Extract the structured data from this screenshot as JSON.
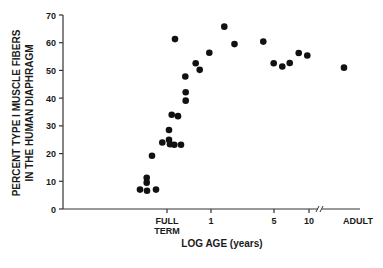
{
  "chart_data": {
    "type": "scatter",
    "title": "",
    "ylabel_line1": "PERCENT TYPE I MUSCLE FIBERS",
    "ylabel_line2": "IN THE HUMAN DIAPHRAGM",
    "xlabel": "LOG AGE (years)",
    "ylim": [
      0,
      70
    ],
    "yticks": [
      0,
      10,
      20,
      30,
      40,
      50,
      60,
      70
    ],
    "xticks": [
      {
        "label": "FULL",
        "label2": "TERM",
        "px": 167
      },
      {
        "label": "1",
        "px": 211
      },
      {
        "label": "5",
        "px": 274
      },
      {
        "label": "10",
        "px": 309
      }
    ],
    "x_break_label": "ADULT",
    "grid": false,
    "legend": null,
    "points_px_note": "x in pixel position along log-age axis; y in percent",
    "points": [
      {
        "x": 140,
        "y": 7
      },
      {
        "x": 147,
        "y": 6.6
      },
      {
        "x": 156,
        "y": 7
      },
      {
        "x": 146.7,
        "y": 9.5
      },
      {
        "x": 146.7,
        "y": 11.3
      },
      {
        "x": 152,
        "y": 19.2
      },
      {
        "x": 162.3,
        "y": 24
      },
      {
        "x": 169,
        "y": 25
      },
      {
        "x": 170,
        "y": 23.4
      },
      {
        "x": 174.3,
        "y": 23.2
      },
      {
        "x": 181,
        "y": 23.2
      },
      {
        "x": 169,
        "y": 28.5
      },
      {
        "x": 171.7,
        "y": 34
      },
      {
        "x": 178,
        "y": 33.5
      },
      {
        "x": 185.7,
        "y": 39.1
      },
      {
        "x": 185.7,
        "y": 42.1
      },
      {
        "x": 185.3,
        "y": 47.8
      },
      {
        "x": 175,
        "y": 61.3
      },
      {
        "x": 195.7,
        "y": 52.6
      },
      {
        "x": 199.7,
        "y": 50.2
      },
      {
        "x": 209.3,
        "y": 56.4
      },
      {
        "x": 224.3,
        "y": 65.8
      },
      {
        "x": 234.5,
        "y": 59.5
      },
      {
        "x": 263.3,
        "y": 60.4
      },
      {
        "x": 273.7,
        "y": 52.6
      },
      {
        "x": 282.3,
        "y": 51.4
      },
      {
        "x": 289.7,
        "y": 52.7
      },
      {
        "x": 298.7,
        "y": 56.3
      },
      {
        "x": 307.3,
        "y": 55.4
      },
      {
        "x": 344,
        "y": 51
      }
    ]
  }
}
